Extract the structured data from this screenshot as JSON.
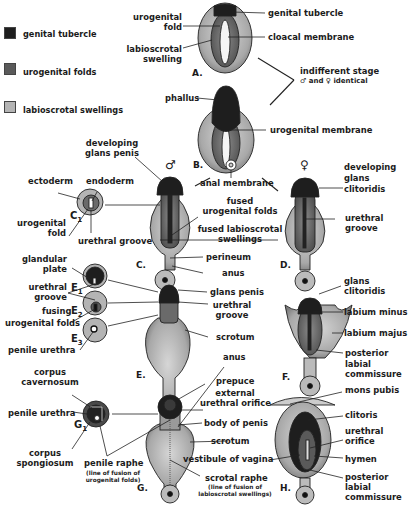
{
  "legend": {
    "items": [
      {
        "label": "genital tubercle",
        "color": "#1e1e1e"
      },
      {
        "label": "urogenital folds",
        "color": "#5a5a5a"
      },
      {
        "label": "labioscrotal swellings",
        "color": "#b4b4b4"
      }
    ]
  },
  "stage_a": {
    "id": "A.",
    "labels": {
      "urogenital_fold": "urogenital\nfold",
      "labioscrotal_swelling": "labioscrotal\nswelling",
      "genital_tubercle": "genital tubercle",
      "cloacal_membrane": "cloacal membrane"
    }
  },
  "indifferent": {
    "line1": "indifferent stage",
    "line2": "♂ and ♀ identical"
  },
  "stage_b": {
    "id": "B.",
    "labels": {
      "phallus": "phallus",
      "urogenital_membrane": "urogenital membrane",
      "anal_membrane": "anal membrane"
    }
  },
  "male_symbol": "♂",
  "female_symbol": "♀",
  "stage_c": {
    "id": "C.",
    "labels": {
      "developing_glans_penis": "developing\nglans penis",
      "fused_urogenital_folds": "fused\nurogenital folds",
      "fused_labioscrotal_swellings": "fused labioscrotal\nswellings",
      "perineum": "perineum",
      "anus": "anus"
    }
  },
  "section_c1": {
    "id": "C",
    "sub": "1",
    "labels": {
      "ectoderm": "ectoderm",
      "endoderm": "endoderm",
      "urogenital_fold": "urogenital\nfold",
      "urethral_groove": "urethral groove"
    }
  },
  "stage_d": {
    "id": "D.",
    "labels": {
      "developing_glans_clitoridis": "developing\nglans\nclitoridis",
      "urethral_groove": "urethral\ngroove"
    }
  },
  "sections_e": {
    "e1": "E",
    "e1_sub": "1",
    "e2": "E",
    "e2_sub": "2",
    "e3": "E",
    "e3_sub": "3",
    "labels": {
      "glandular_plate": "glandular\nplate",
      "urethral_groove": "urethral\ngroove",
      "fusing_urogenital_folds_1": "fusing",
      "fusing_urogenital_folds_2": "urogenital folds",
      "penile_urethra": "penile urethra"
    }
  },
  "stage_e": {
    "id": "E.",
    "labels": {
      "glans_penis": "glans penis",
      "urethral_groove": "urethral\ngroove",
      "scrotum": "scrotum",
      "anus": "anus"
    }
  },
  "stage_f": {
    "id": "F.",
    "labels": {
      "glans_clitoridis": "glans\nclitoridis",
      "labium_minus": "labium minus",
      "labium_majus": "labium majus",
      "posterior_labial_commissure": "posterior\nlabial\ncommissure"
    }
  },
  "section_g1": {
    "id": "G",
    "sub": "1",
    "labels": {
      "corpus_cavernosum": "corpus\ncavernosum",
      "penile_urethra": "penile urethra",
      "corpus_spongiosum": "corpus\nspongiosum",
      "penile_raphe": "penile raphe",
      "penile_raphe_note": "(line of fusion of\nurogenital folds)"
    }
  },
  "stage_g": {
    "id": "G.",
    "labels": {
      "prepuce": "prepuce",
      "external_urethral_orifice": "external\nurethral orifice",
      "body_of_penis": "body of penis",
      "scrotum": "scrotum",
      "scrotal_raphe": "scrotal raphe",
      "scrotal_raphe_note": "(line of fusion of\nlabioscrotal swellings)"
    }
  },
  "stage_h": {
    "id": "H.",
    "labels": {
      "mons_pubis": "mons pubis",
      "clitoris": "clitoris",
      "urethral_orifice": "urethral\norifice",
      "vestibule_of_vagina": "vestibule of vagina",
      "hymen": "hymen",
      "posterior_labial_commissure": "posterior\nlabial\ncommissure"
    }
  }
}
